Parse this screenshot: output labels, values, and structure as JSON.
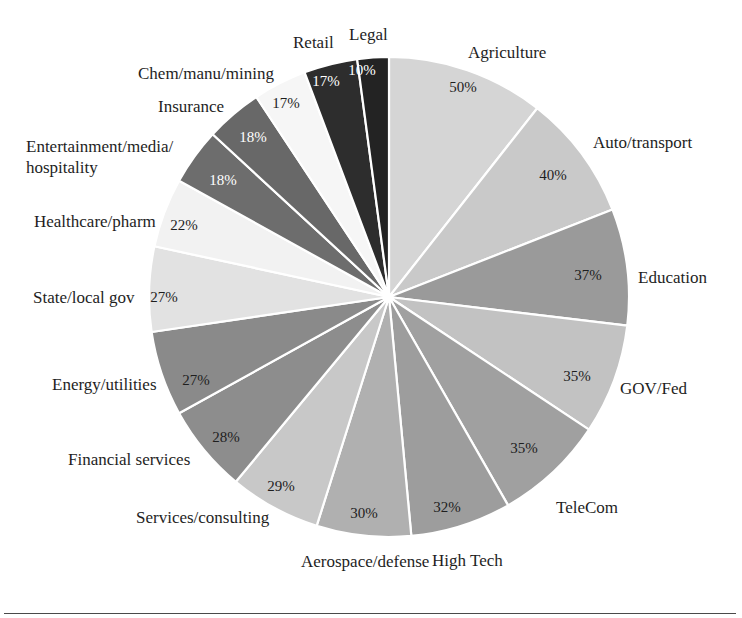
{
  "figure": {
    "background_color": "#ffffff",
    "rule_color": "#4a4a4a",
    "center_x": 389,
    "center_y": 297,
    "radius": 240,
    "start_angle_deg": -90,
    "separator_color": "#ffffff",
    "value_label_suffix": "%"
  },
  "chart_data": {
    "type": "pie",
    "title": "",
    "subtitle": "",
    "xlabel": "",
    "ylabel": "",
    "legend_position": "none",
    "grid": false,
    "value_unit": "percent",
    "labels": [
      "Agriculture",
      "Auto/transport",
      "Education",
      "GOV/Fed",
      "TeleCom",
      "High Tech",
      "Aerospace/defense",
      "Services/consulting",
      "Financial services",
      "Energy/utilities",
      "State/local gov",
      "Healthcare/pharm",
      "Entertainment/media/ hospitality",
      "Insurance",
      "Chem/manu/mining",
      "Retail",
      "Legal"
    ],
    "values": [
      50,
      40,
      37,
      35,
      35,
      32,
      30,
      29,
      28,
      27,
      27,
      22,
      18,
      18,
      17,
      17,
      10
    ],
    "value_labels": [
      "50%",
      "40%",
      "37%",
      "35%",
      "35%",
      "32%",
      "30%",
      "29%",
      "28%",
      "27%",
      "27%",
      "22%",
      "18%",
      "18%",
      "17%",
      "17%",
      "10%"
    ],
    "colors": [
      "#d5d5d5",
      "#c9c9c9",
      "#9a9a9a",
      "#c2c2c2",
      "#a0a0a0",
      "#9d9d9d",
      "#b0b0b0",
      "#c8c8c8",
      "#8d8d8d",
      "#8a8a8a",
      "#e2e2e2",
      "#f2f2f2",
      "#6d6d6d",
      "#686868",
      "#f6f6f6",
      "#2d2d2d",
      "#232323"
    ],
    "value_text_colors": [
      "#1e1e1e",
      "#1e1e1e",
      "#1e1e1e",
      "#1e1e1e",
      "#1e1e1e",
      "#1e1e1e",
      "#1e1e1e",
      "#1e1e1e",
      "#1e1e1e",
      "#1e1e1e",
      "#1e1e1e",
      "#1e1e1e",
      "#ffffff",
      "#ffffff",
      "#1e1e1e",
      "#ffffff",
      "#ffffff"
    ]
  },
  "slices": [
    {
      "name": "Agriculture",
      "value": 50,
      "value_label": "50%",
      "color": "#d5d5d5",
      "value_text_color": "#1e1e1e",
      "value_pos": {
        "x": 463,
        "y": 92
      },
      "label_pos": {
        "x": 468,
        "y": 58
      },
      "label_anchor": "start",
      "label_lines": [
        "Agriculture"
      ]
    },
    {
      "name": "Auto/transport",
      "value": 40,
      "value_label": "40%",
      "color": "#c9c9c9",
      "value_text_color": "#1e1e1e",
      "value_pos": {
        "x": 553,
        "y": 180
      },
      "label_pos": {
        "x": 593,
        "y": 148
      },
      "label_anchor": "start",
      "label_lines": [
        "Auto/transport"
      ]
    },
    {
      "name": "Education",
      "value": 37,
      "value_label": "37%",
      "color": "#9a9a9a",
      "value_text_color": "#1e1e1e",
      "value_pos": {
        "x": 588,
        "y": 280
      },
      "label_pos": {
        "x": 638,
        "y": 283
      },
      "label_anchor": "start",
      "label_lines": [
        "Education"
      ]
    },
    {
      "name": "GOV/Fed",
      "value": 35,
      "value_label": "35%",
      "color": "#c2c2c2",
      "value_text_color": "#1e1e1e",
      "value_pos": {
        "x": 577,
        "y": 381
      },
      "label_pos": {
        "x": 620,
        "y": 394
      },
      "label_anchor": "start",
      "label_lines": [
        "GOV/Fed"
      ]
    },
    {
      "name": "TeleCom",
      "value": 35,
      "value_label": "35%",
      "color": "#a0a0a0",
      "value_text_color": "#1e1e1e",
      "value_pos": {
        "x": 524,
        "y": 453
      },
      "label_pos": {
        "x": 556,
        "y": 513
      },
      "label_anchor": "start",
      "label_lines": [
        "TeleCom"
      ]
    },
    {
      "name": "High Tech",
      "value": 32,
      "value_label": "32%",
      "color": "#9d9d9d",
      "value_text_color": "#1e1e1e",
      "value_pos": {
        "x": 447,
        "y": 512
      },
      "label_pos": {
        "x": 432,
        "y": 566
      },
      "label_anchor": "start",
      "label_lines": [
        "High Tech"
      ]
    },
    {
      "name": "Aerospace/defense",
      "value": 30,
      "value_label": "30%",
      "color": "#b0b0b0",
      "value_text_color": "#1e1e1e",
      "value_pos": {
        "x": 364,
        "y": 518
      },
      "label_pos": {
        "x": 301,
        "y": 567
      },
      "label_anchor": "start",
      "label_lines": [
        "Aerospace/defense"
      ]
    },
    {
      "name": "Services/consulting",
      "value": 29,
      "value_label": "29%",
      "color": "#c8c8c8",
      "value_text_color": "#1e1e1e",
      "value_pos": {
        "x": 281,
        "y": 491
      },
      "label_pos": {
        "x": 136,
        "y": 523
      },
      "label_anchor": "start",
      "label_lines": [
        "Services/consulting"
      ]
    },
    {
      "name": "Financial services",
      "value": 28,
      "value_label": "28%",
      "color": "#8d8d8d",
      "value_text_color": "#1e1e1e",
      "value_pos": {
        "x": 226,
        "y": 442
      },
      "label_pos": {
        "x": 68,
        "y": 465
      },
      "label_anchor": "start",
      "label_lines": [
        "Financial services"
      ]
    },
    {
      "name": "Energy/utilities",
      "value": 27,
      "value_label": "27%",
      "color": "#8a8a8a",
      "value_text_color": "#1e1e1e",
      "value_pos": {
        "x": 196,
        "y": 385
      },
      "label_pos": {
        "x": 52,
        "y": 390
      },
      "label_anchor": "start",
      "label_lines": [
        "Energy/utilities"
      ]
    },
    {
      "name": "State/local gov",
      "value": 27,
      "value_label": "27%",
      "color": "#e2e2e2",
      "value_text_color": "#1e1e1e",
      "value_pos": {
        "x": 164,
        "y": 302
      },
      "label_pos": {
        "x": 33,
        "y": 303
      },
      "label_anchor": "start",
      "label_lines": [
        "State/local gov"
      ]
    },
    {
      "name": "Healthcare/pharm",
      "value": 22,
      "value_label": "22%",
      "color": "#f2f2f2",
      "value_text_color": "#1e1e1e",
      "value_pos": {
        "x": 184,
        "y": 230
      },
      "label_pos": {
        "x": 34,
        "y": 227
      },
      "label_anchor": "start",
      "label_lines": [
        "Healthcare/pharm"
      ]
    },
    {
      "name": "Entertainment/media/hospitality",
      "value": 18,
      "value_label": "18%",
      "color": "#6d6d6d",
      "value_text_color": "#ffffff",
      "value_pos": {
        "x": 223,
        "y": 185
      },
      "label_pos": {
        "x": 26,
        "y": 152
      },
      "label_anchor": "start",
      "label_lines": [
        "Entertainment/media/",
        "hospitality"
      ]
    },
    {
      "name": "Insurance",
      "value": 18,
      "value_label": "18%",
      "color": "#686868",
      "value_text_color": "#ffffff",
      "value_pos": {
        "x": 253,
        "y": 142
      },
      "label_pos": {
        "x": 158,
        "y": 112
      },
      "label_anchor": "start",
      "label_lines": [
        "Insurance"
      ]
    },
    {
      "name": "Chem/manu/mining",
      "value": 17,
      "value_label": "17%",
      "color": "#f6f6f6",
      "value_text_color": "#1e1e1e",
      "value_pos": {
        "x": 286,
        "y": 108
      },
      "label_pos": {
        "x": 138,
        "y": 79
      },
      "label_anchor": "start",
      "label_lines": [
        "Chem/manu/mining"
      ]
    },
    {
      "name": "Retail",
      "value": 17,
      "value_label": "17%",
      "color": "#2d2d2d",
      "value_text_color": "#ffffff",
      "value_pos": {
        "x": 326,
        "y": 86
      },
      "label_pos": {
        "x": 293,
        "y": 48
      },
      "label_anchor": "start",
      "label_lines": [
        "Retail"
      ]
    },
    {
      "name": "Legal",
      "value": 10,
      "value_label": "10%",
      "color": "#232323",
      "value_text_color": "#ffffff",
      "value_pos": {
        "x": 362,
        "y": 75
      },
      "label_pos": {
        "x": 349,
        "y": 40
      },
      "label_anchor": "start",
      "label_lines": [
        "Legal"
      ]
    }
  ]
}
